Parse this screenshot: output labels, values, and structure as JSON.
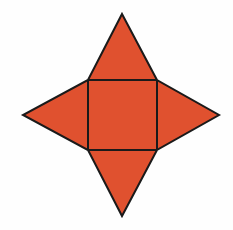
{
  "figure": {
    "name": "four-pointed-star-net",
    "canvas": {
      "width": 233,
      "height": 230
    },
    "background_color": "#FEFEFE",
    "fill_color": "#E0512F",
    "stroke_color": "#1A1A1A",
    "stroke_width": 2,
    "square_stroke_width": 2,
    "square": {
      "name": "central-square",
      "left": 88,
      "top": 80,
      "right": 157,
      "bottom": 150,
      "width": 69,
      "height": 70,
      "corners": [
        {
          "label": "top-left",
          "x": 88,
          "y": 80
        },
        {
          "label": "top-right",
          "x": 157,
          "y": 80
        },
        {
          "label": "bottom-right",
          "x": 157,
          "y": 150
        },
        {
          "label": "bottom-left",
          "x": 88,
          "y": 150
        }
      ]
    },
    "points": [
      {
        "name": "top-apex",
        "x": 122,
        "y": 14
      },
      {
        "name": "right-apex",
        "x": 219,
        "y": 115
      },
      {
        "name": "bottom-apex",
        "x": 122,
        "y": 216
      },
      {
        "name": "left-apex",
        "x": 23,
        "y": 115
      }
    ],
    "triangles": [
      {
        "name": "top-triangle",
        "apex": {
          "x": 122,
          "y": 14
        },
        "base": [
          {
            "x": 88,
            "y": 80
          },
          {
            "x": 157,
            "y": 80
          }
        ]
      },
      {
        "name": "right-triangle",
        "apex": {
          "x": 219,
          "y": 115
        },
        "base": [
          {
            "x": 157,
            "y": 80
          },
          {
            "x": 157,
            "y": 150
          }
        ]
      },
      {
        "name": "bottom-triangle",
        "apex": {
          "x": 122,
          "y": 216
        },
        "base": [
          {
            "x": 157,
            "y": 150
          },
          {
            "x": 88,
            "y": 150
          }
        ]
      },
      {
        "name": "left-triangle",
        "apex": {
          "x": 23,
          "y": 115
        },
        "base": [
          {
            "x": 88,
            "y": 150
          },
          {
            "x": 88,
            "y": 80
          }
        ]
      }
    ],
    "outline_path": "M 122 14 L 157 80 L 219 115 L 157 150 L 122 216 L 88 150 L 23 115 L 88 80 Z"
  }
}
